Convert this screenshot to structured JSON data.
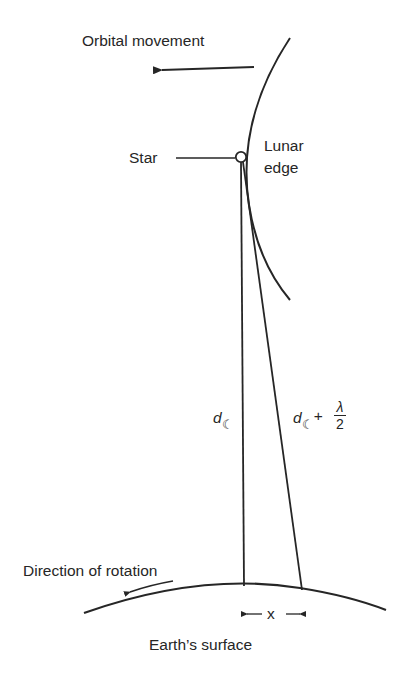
{
  "diagram": {
    "type": "lunar-occultation-geometry",
    "labels": {
      "orbital_movement": "Orbital movement",
      "star": "Star",
      "lunar_edge_line1": "Lunar",
      "lunar_edge_line2": "edge",
      "distance_left": "d",
      "distance_right": "d",
      "plus": "+",
      "lambda": "λ",
      "two": "2",
      "moon_symbol": "☾",
      "direction_of_rotation": "Direction of rotation",
      "x": "x",
      "earth_surface": "Earth’s surface"
    },
    "colors": {
      "stroke": "#262626",
      "background": "#ffffff"
    }
  }
}
